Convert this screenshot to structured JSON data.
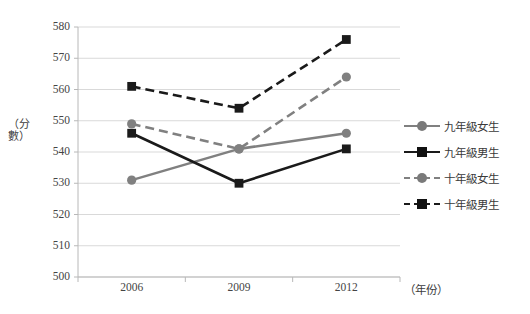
{
  "chart_data": {
    "type": "line",
    "title": "",
    "xlabel": "（年份）",
    "ylabel": "（分數）",
    "categories": [
      "2006",
      "2009",
      "2012"
    ],
    "x": [
      2006,
      2009,
      2012
    ],
    "ylim": [
      500,
      580
    ],
    "yticks": [
      500,
      510,
      520,
      530,
      540,
      550,
      560,
      570,
      580
    ],
    "ytick_labels": [
      "500",
      "510",
      "520",
      "530",
      "540",
      "550",
      "560",
      "570",
      "580"
    ],
    "grid": true,
    "grid_axis": "y",
    "legend_position": "right",
    "series": [
      {
        "name": "九年級女生",
        "values": [
          531,
          541,
          546
        ],
        "color": "#808080",
        "marker": "circle",
        "linestyle": "solid"
      },
      {
        "name": "九年級男生",
        "values": [
          546,
          530,
          541
        ],
        "color": "#1a1a1a",
        "marker": "square",
        "linestyle": "solid"
      },
      {
        "name": "十年級女生",
        "values": [
          549,
          541,
          564
        ],
        "color": "#808080",
        "marker": "circle",
        "linestyle": "dashed"
      },
      {
        "name": "十年級男生",
        "values": [
          561,
          554,
          576
        ],
        "color": "#1a1a1a",
        "marker": "square",
        "linestyle": "dashed"
      }
    ]
  },
  "colors": {
    "gray_series": "#808080",
    "black_series": "#1a1a1a",
    "gridline": "#d9d9d9",
    "axis": "#b8b8b8",
    "text": "#3a3a3a",
    "background": "#ffffff"
  },
  "axis": {
    "y_title": "（分數）",
    "x_title": "（年份）"
  },
  "legend": {
    "items": [
      {
        "label": "九年級女生"
      },
      {
        "label": "九年級男生"
      },
      {
        "label": "十年級女生"
      },
      {
        "label": "十年級男生"
      }
    ]
  }
}
